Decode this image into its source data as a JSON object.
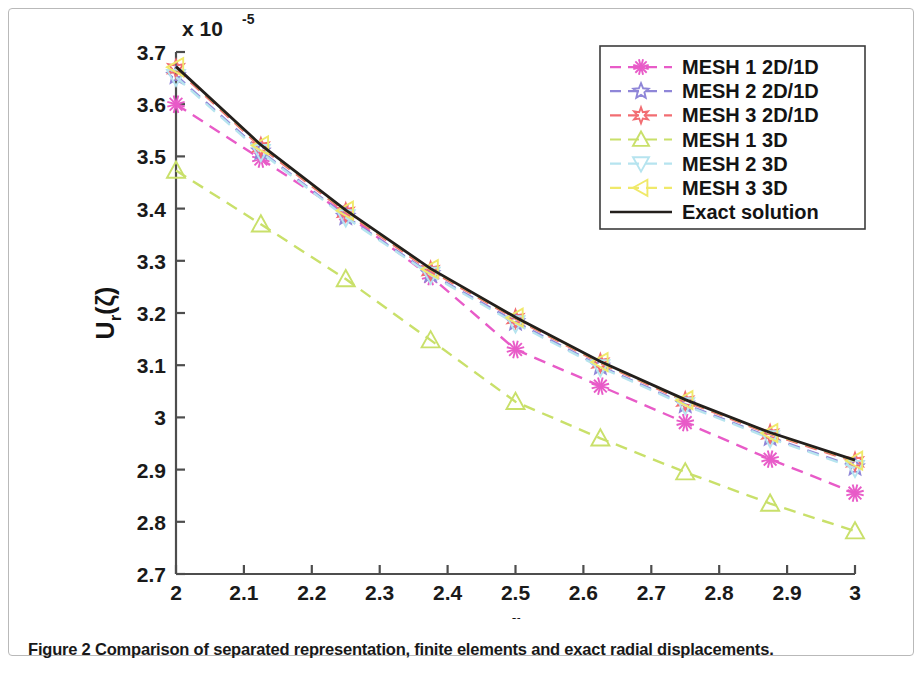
{
  "caption": "Figure 2 Comparison of separated representation, finite elements and exact radial displacements.",
  "chart_data": {
    "type": "line",
    "title": "",
    "xlabel": "r",
    "ylabel": "U_r(ζ)",
    "y_exponent_label": "x 10",
    "y_exponent_power": "-5",
    "xlim": [
      2,
      3
    ],
    "ylim": [
      2.7,
      3.7
    ],
    "xticks": [
      "2",
      "2.1",
      "2.2",
      "2.3",
      "2.4",
      "2.5",
      "2.6",
      "2.7",
      "2.8",
      "2.9",
      "3"
    ],
    "xtick_values": [
      2,
      2.1,
      2.2,
      2.3,
      2.4,
      2.5,
      2.6,
      2.7,
      2.8,
      2.9,
      3
    ],
    "yticks": [
      "2.7",
      "2.8",
      "2.9",
      "3",
      "3.1",
      "3.2",
      "3.3",
      "3.4",
      "3.5",
      "3.6",
      "3.7"
    ],
    "ytick_values": [
      2.7,
      2.8,
      2.9,
      3.0,
      3.1,
      3.2,
      3.3,
      3.4,
      3.5,
      3.6,
      3.7
    ],
    "grid": false,
    "legend_position": "top-right",
    "series": [
      {
        "name": "MESH 1 2D/1D",
        "color": "#e85bc8",
        "style": "dashed",
        "marker": "asterisk",
        "x": [
          2.0,
          2.125,
          2.25,
          2.375,
          2.5,
          2.625,
          2.75,
          2.875,
          3.0
        ],
        "values": [
          3.6,
          3.495,
          3.39,
          3.27,
          3.13,
          3.06,
          2.99,
          2.92,
          2.855
        ]
      },
      {
        "name": "MESH 2 2D/1D",
        "color": "#8f86d8",
        "style": "dashed",
        "marker": "star",
        "x": [
          2.0,
          2.125,
          2.25,
          2.375,
          2.5,
          2.625,
          2.75,
          2.875,
          3.0
        ],
        "values": [
          3.655,
          3.51,
          3.385,
          3.275,
          3.183,
          3.098,
          3.025,
          2.962,
          2.905
        ]
      },
      {
        "name": "MESH 3 2D/1D",
        "color": "#f26d72",
        "style": "dashed",
        "marker": "hexagram",
        "x": [
          2.0,
          2.125,
          2.25,
          2.375,
          2.5,
          2.625,
          2.75,
          2.875,
          3.0
        ],
        "values": [
          3.668,
          3.518,
          3.393,
          3.281,
          3.189,
          3.104,
          3.031,
          2.968,
          2.915
        ]
      },
      {
        "name": "MESH 1 3D",
        "color": "#c9e06a",
        "style": "dashed",
        "marker": "triangle-up",
        "x": [
          2.0,
          2.125,
          2.25,
          2.375,
          2.5,
          2.625,
          2.75,
          2.875,
          3.0
        ],
        "values": [
          3.473,
          3.37,
          3.265,
          3.148,
          3.03,
          2.96,
          2.895,
          2.835,
          2.782
        ]
      },
      {
        "name": "MESH 2 3D",
        "color": "#b6e4ef",
        "style": "dashed",
        "marker": "triangle-down",
        "x": [
          2.0,
          2.125,
          2.25,
          2.375,
          2.5,
          2.625,
          2.75,
          2.875,
          3.0
        ],
        "values": [
          3.652,
          3.508,
          3.383,
          3.273,
          3.18,
          3.096,
          3.023,
          2.96,
          2.903
        ]
      },
      {
        "name": "MESH 3 3D",
        "color": "#f0e96a",
        "style": "dashed",
        "marker": "triangle-left",
        "x": [
          2.0,
          2.125,
          2.25,
          2.375,
          2.5,
          2.625,
          2.75,
          2.875,
          3.0
        ],
        "values": [
          3.671,
          3.521,
          3.396,
          3.284,
          3.191,
          3.106,
          3.033,
          2.97,
          2.917
        ]
      },
      {
        "name": "Exact solution",
        "color": "#231f1c",
        "style": "solid",
        "marker": "none",
        "x": [
          2.0,
          2.125,
          2.25,
          2.375,
          2.5,
          2.625,
          2.75,
          2.875,
          3.0
        ],
        "values": [
          3.672,
          3.522,
          3.397,
          3.285,
          3.192,
          3.107,
          3.034,
          2.971,
          2.918
        ]
      }
    ]
  },
  "plot_geometry": {
    "left": 176,
    "right": 855,
    "top": 52,
    "bottom": 574
  },
  "legend_geometry": {
    "x": 600,
    "y": 46,
    "width": 265,
    "height": 183
  }
}
